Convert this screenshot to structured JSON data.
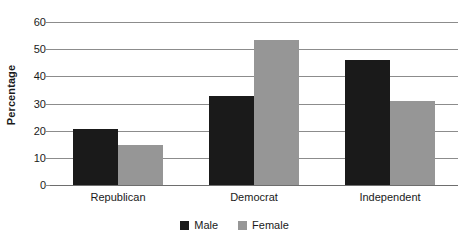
{
  "chart_data": {
    "type": "bar",
    "title": "",
    "xlabel": "",
    "ylabel": "Percentage",
    "categories": [
      "Republican",
      "Democrat",
      "Independent"
    ],
    "series": [
      {
        "name": "Male",
        "color": "#1a1a1a",
        "values": [
          20.5,
          32.7,
          46.0
        ]
      },
      {
        "name": "Female",
        "color": "#969696",
        "values": [
          14.7,
          53.3,
          31.0
        ]
      }
    ],
    "ylim": [
      0,
      60
    ],
    "yticks": [
      0,
      10,
      20,
      30,
      40,
      50,
      60
    ],
    "ytick_labels": [
      "0",
      "10",
      "20",
      "30",
      "40",
      "50",
      "60"
    ],
    "grid": true,
    "grid_axis": "y",
    "legend_position": "bottom",
    "legend_entries": [
      "Male",
      "Female"
    ],
    "background": "#ffffff",
    "gridline_color": "#8c8c8c",
    "axis_color": "#6e6e6e",
    "text_color": "#1a1a1a"
  }
}
